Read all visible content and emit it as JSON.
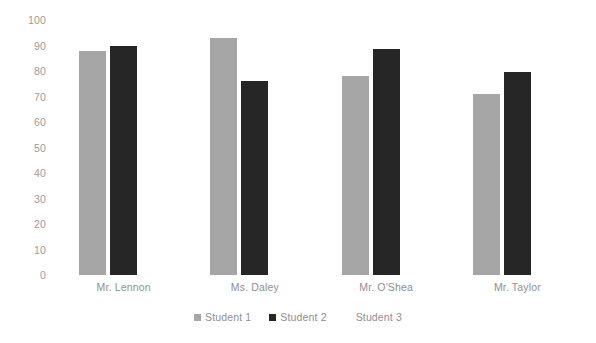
{
  "chart_data": {
    "type": "bar",
    "title": "",
    "subtitle": "",
    "xlabel": "",
    "ylabel": "",
    "categories": [
      "Mr. Lennon",
      "Ms. Daley",
      "Mr. O'Shea",
      "Mr. Taylor"
    ],
    "series": [
      {
        "name": "Student 1",
        "color": "#a6a6a6",
        "values": [
          88,
          93,
          78,
          71
        ]
      },
      {
        "name": "Student 2",
        "color": "#262626",
        "values": [
          90,
          76,
          88.5,
          79.5
        ]
      },
      {
        "name": "Student 3",
        "color": "#ffffff",
        "values": [
          0,
          0,
          0,
          0
        ]
      }
    ],
    "ylim": [
      0,
      100
    ],
    "y_ticks": [
      0,
      10,
      20,
      30,
      40,
      50,
      60,
      70,
      80,
      90,
      100
    ],
    "y_tick_labels": [
      "0",
      "10",
      "20",
      "30",
      "40",
      "50",
      "60",
      "70",
      "80",
      "90",
      "100"
    ],
    "grid": false,
    "legend_position": "bottom",
    "background_color": "#ffffff",
    "tick_label_color": "#9b9b9b",
    "category_label_color": "#8f8f8f"
  },
  "legend": {
    "items": [
      {
        "label": "Student 1",
        "color": "#a6a6a6",
        "swatch_visible": true
      },
      {
        "label": "Student 2",
        "color": "#262626",
        "swatch_visible": true
      },
      {
        "label": "Student 3",
        "color": "#ffffff",
        "swatch_visible": false
      }
    ]
  }
}
